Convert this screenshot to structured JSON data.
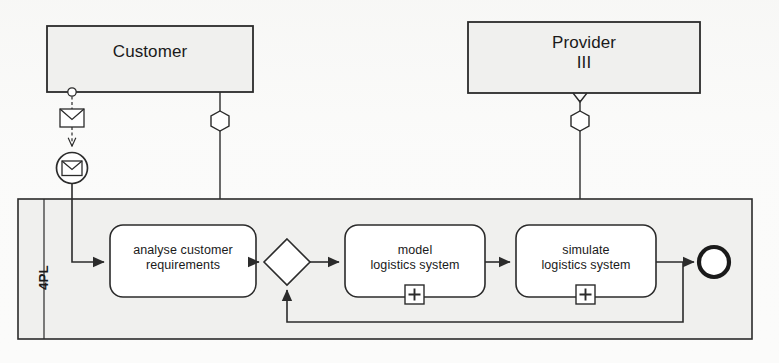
{
  "diagram": {
    "type": "bpmn-collaboration",
    "background_color": "#fbfbfa",
    "stroke_color": "#2b2b2b",
    "pool_fill": "#f1f1ef",
    "task_fill": "#ffffff"
  },
  "pools": [
    {
      "id": "customer",
      "name": "Customer",
      "kind": "black-box-pool",
      "x": 47,
      "y": 26,
      "w": 206,
      "h": 66,
      "fill": "#f1f1ef"
    },
    {
      "id": "provider",
      "name": "Provider\nIII",
      "kind": "black-box-pool",
      "x": 468,
      "y": 22,
      "w": 232,
      "h": 71,
      "fill": "#f1f1ef"
    },
    {
      "id": "fourpl",
      "name": "4PL",
      "kind": "process-pool",
      "x": 18,
      "y": 199,
      "w": 734,
      "h": 140,
      "fill": "#f1f1ef",
      "lane_header_width": 26
    }
  ],
  "tasks": [
    {
      "id": "analyse",
      "label": "analyse customer\nrequirements",
      "x": 110,
      "y": 225,
      "w": 146,
      "h": 72,
      "marker": null
    },
    {
      "id": "model",
      "label": "model\nlogistics system",
      "x": 345,
      "y": 225,
      "w": 140,
      "h": 72,
      "marker": "sub-process-collapsed"
    },
    {
      "id": "simulate",
      "label": "simulate\nlogistics system",
      "x": 516,
      "y": 225,
      "w": 140,
      "h": 72,
      "marker": "sub-process-collapsed"
    }
  ],
  "markers": {
    "collapsed_subprocess_glyph": "+"
  },
  "events": [
    {
      "id": "start-message",
      "kind": "message-start-event",
      "cx": 72,
      "cy": 168,
      "r": 15,
      "inner_icon": "envelope-icon"
    },
    {
      "id": "end-event",
      "kind": "end-event",
      "cx": 714,
      "cy": 262,
      "r": 16,
      "border_width": 4
    }
  ],
  "gateways": [
    {
      "id": "gateway-xor",
      "kind": "exclusive-gateway",
      "cx": 287,
      "cy": 262,
      "half": 23
    }
  ],
  "artifacts": [
    {
      "id": "message-envelope",
      "kind": "message-icon",
      "x": 60,
      "y": 110,
      "w": 24,
      "h": 18
    },
    {
      "id": "customer-connector-circle",
      "kind": "connector-circle",
      "cx": 72,
      "cy": 92,
      "r": 4
    },
    {
      "id": "customer-hexagon",
      "kind": "hexagon-connector",
      "cx": 220,
      "cy": 121,
      "w": 22,
      "h": 20
    },
    {
      "id": "provider-hexagon",
      "kind": "hexagon-connector",
      "cx": 580,
      "cy": 121,
      "w": 22,
      "h": 20
    }
  ],
  "flows": [
    {
      "id": "f-start-to-analyse",
      "from": "start-message",
      "to": "analyse",
      "style": "sequence"
    },
    {
      "id": "f-analyse-to-gateway",
      "from": "analyse",
      "to": "gateway-xor",
      "style": "sequence"
    },
    {
      "id": "f-gateway-to-model",
      "from": "gateway-xor",
      "to": "model",
      "style": "sequence"
    },
    {
      "id": "f-model-to-simulate",
      "from": "model",
      "to": "simulate",
      "style": "sequence"
    },
    {
      "id": "f-simulate-to-end",
      "from": "simulate",
      "to": "end-event",
      "style": "sequence"
    },
    {
      "id": "f-loop-back",
      "from": "simulate",
      "to": "gateway-xor",
      "style": "sequence-loop"
    },
    {
      "id": "f-customer-message",
      "from": "customer",
      "to": "start-message",
      "style": "message"
    },
    {
      "id": "f-customer-association",
      "from": "customer",
      "to": "fourpl",
      "style": "association"
    },
    {
      "id": "f-provider-association",
      "from": "provider",
      "to": "fourpl",
      "style": "association"
    }
  ]
}
